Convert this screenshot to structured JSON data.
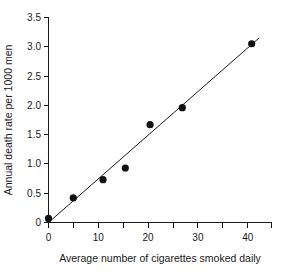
{
  "chart_data": {
    "type": "scatter",
    "title": "",
    "xlabel": "Average number of cigarettes smoked daily",
    "ylabel": "Annual death rate per 1000 men",
    "xlim": [
      0,
      45
    ],
    "ylim": [
      0,
      3.5
    ],
    "grid": false,
    "legend": null,
    "x_major_ticks": [
      0,
      10,
      20,
      30,
      40
    ],
    "x_major_tick_labels": [
      "0",
      "10",
      "20",
      "30",
      "40"
    ],
    "x_minor_ticks": [
      5,
      15,
      25,
      35,
      45
    ],
    "y_major_ticks": [
      0,
      0.5,
      1.0,
      1.5,
      2.0,
      2.5,
      3.0,
      3.5
    ],
    "y_major_tick_labels": [
      "0",
      "0.5",
      "1.0",
      "1.5",
      "2.0",
      "2.5",
      "3.0",
      "3.5"
    ],
    "points": [
      {
        "x": 0,
        "y": 0.07
      },
      {
        "x": 5,
        "y": 0.42
      },
      {
        "x": 11,
        "y": 0.73
      },
      {
        "x": 15.5,
        "y": 0.93
      },
      {
        "x": 20.5,
        "y": 1.67
      },
      {
        "x": 27,
        "y": 1.96
      },
      {
        "x": 41,
        "y": 3.05
      }
    ],
    "fit_line": {
      "type": "linear",
      "x_start": 0,
      "y_start": 0.0,
      "x_end": 42.5,
      "y_end": 3.15
    },
    "marker": {
      "shape": "circle",
      "color": "#111111",
      "size_px": 5
    },
    "line_color": "#1a1a1a",
    "axis_color": "#1a1a1a",
    "background_color": "#ffffff"
  }
}
